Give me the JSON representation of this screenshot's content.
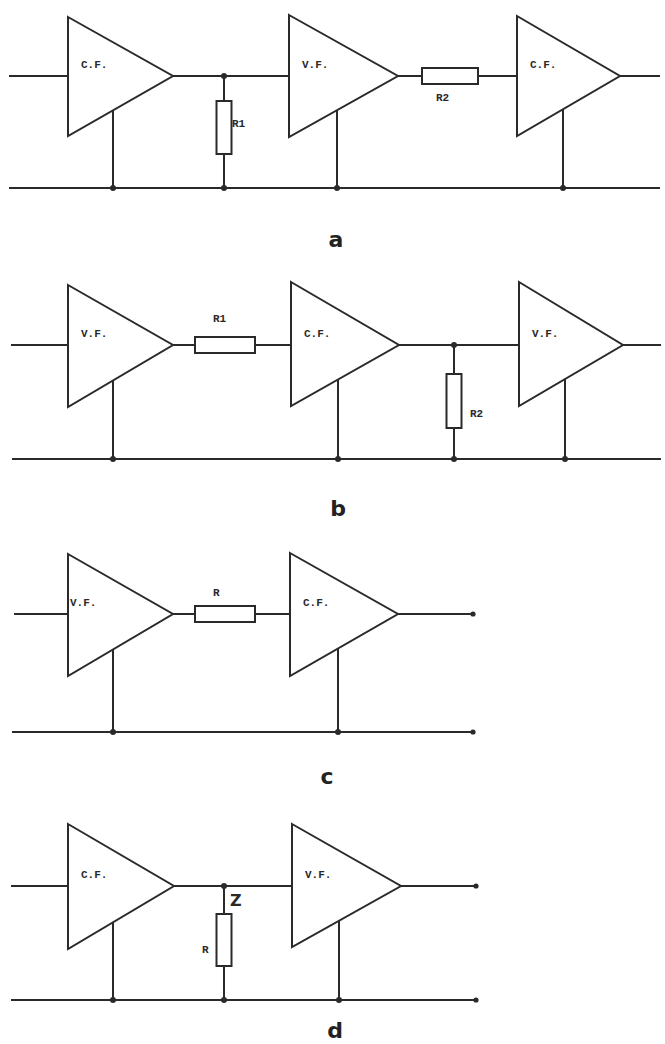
{
  "figure": {
    "width": 665,
    "height": 1044,
    "line_color": "#2a2a2a",
    "panels": [
      {
        "id": "a",
        "label": "a",
        "label_pos": [
          336,
          247
        ],
        "signal_y": 76,
        "ground_y": 188,
        "input_x": 10,
        "ground_x": [
          10,
          659
        ],
        "output_x": 659,
        "output_terminal": false,
        "amplifiers": [
          {
            "type": "C.F.",
            "left": 68,
            "top": 17,
            "bottom": 136,
            "tip": 173,
            "ground_tap_x": 113
          },
          {
            "type": "V.F.",
            "left": 289,
            "top": 15,
            "bottom": 137,
            "tip": 398,
            "ground_tap_x": 337
          },
          {
            "type": "C.F.",
            "left": 517,
            "top": 16,
            "bottom": 136,
            "tip": 620,
            "ground_tap_x": 563
          }
        ],
        "series_resistors": [
          {
            "name": "R2",
            "x1": 422,
            "x2": 478,
            "label_pos": [
              436,
              101
            ]
          }
        ],
        "shunt_resistors": [
          {
            "name": "R1",
            "x": 224,
            "top": 101,
            "bottom": 154,
            "label_pos": [
              232,
              127
            ]
          }
        ],
        "node_labels": []
      },
      {
        "id": "b",
        "label": "b",
        "label_pos": [
          338,
          516
        ],
        "signal_y": 345,
        "ground_y": 459,
        "input_x": 12,
        "ground_x": [
          13,
          660
        ],
        "output_x": 660,
        "output_terminal": false,
        "amplifiers": [
          {
            "type": "V.F.",
            "left": 68,
            "top": 285,
            "bottom": 407,
            "tip": 173,
            "ground_tap_x": 113
          },
          {
            "type": "C.F.",
            "left": 291,
            "top": 282,
            "bottom": 406,
            "tip": 399,
            "ground_tap_x": 338
          },
          {
            "type": "V.F.",
            "left": 519,
            "top": 282,
            "bottom": 406,
            "tip": 623,
            "ground_tap_x": 565
          }
        ],
        "series_resistors": [
          {
            "name": "R1",
            "x1": 195,
            "x2": 255,
            "label_pos": [
              213,
              322
            ]
          }
        ],
        "shunt_resistors": [
          {
            "name": "R2",
            "x": 454,
            "top": 374,
            "bottom": 428,
            "label_pos": [
              470,
              417
            ]
          }
        ],
        "node_labels": []
      },
      {
        "id": "c",
        "label": "c",
        "label_pos": [
          327,
          784
        ],
        "signal_y": 614,
        "ground_y": 732,
        "input_x": 15,
        "ground_x": [
          13,
          473
        ],
        "output_x": 473,
        "output_terminal": true,
        "amplifiers": [
          {
            "type": "V.F.",
            "left": 68,
            "top": 554,
            "bottom": 676,
            "tip": 173,
            "ground_tap_x": 113
          },
          {
            "type": "C.F.",
            "left": 290,
            "top": 553,
            "bottom": 676,
            "tip": 398,
            "ground_tap_x": 338
          }
        ],
        "series_resistors": [
          {
            "name": "R",
            "x1": 195,
            "x2": 255,
            "label_pos": [
              213,
              596
            ]
          }
        ],
        "shunt_resistors": [],
        "node_labels": []
      },
      {
        "id": "d",
        "label": "d",
        "label_pos": [
          335,
          1038
        ],
        "signal_y": 886,
        "ground_y": 1000,
        "input_x": 12,
        "ground_x": [
          12,
          476
        ],
        "output_x": 476,
        "output_terminal": true,
        "amplifiers": [
          {
            "type": "C.F.",
            "left": 68,
            "top": 824,
            "bottom": 949,
            "tip": 174,
            "ground_tap_x": 113
          },
          {
            "type": "V.F.",
            "left": 292,
            "top": 824,
            "bottom": 947,
            "tip": 401,
            "ground_tap_x": 339
          }
        ],
        "series_resistors": [],
        "shunt_resistors": [
          {
            "name": "R",
            "x": 224,
            "top": 914,
            "bottom": 966,
            "label_pos": [
              202,
              953
            ]
          }
        ],
        "node_labels": [
          {
            "text": "Z",
            "pos": [
              230,
              906
            ]
          }
        ]
      }
    ]
  }
}
